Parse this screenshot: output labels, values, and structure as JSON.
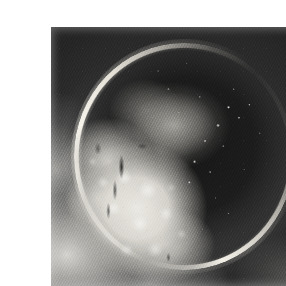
{
  "page": {
    "kind": "medical-photograph",
    "width": 286,
    "height": 286,
    "background_color": "#ffffff",
    "caption": ""
  },
  "photo": {
    "modality": "otoscopic / endoscopic still photograph",
    "color_mode": "grayscale",
    "alt": "Grayscale otoscopic photograph showing a dark circular canal lumen bounded by a bright crescent speculum reflection, containing a large whitish nodular cauliflower-like keratinous mass in the lower-left and mid-gray mucosal soft tissue with scattered specular highlights in the upper-right.",
    "frame": {
      "left": 11,
      "top": 11,
      "width": 261,
      "height": 259
    },
    "colors": {
      "paper": "#ffffff",
      "surrounding_tissue": "#4a4a4a",
      "canal_dark": "#161616",
      "rim_highlight": "#fffdf5",
      "nodular_mass": "#efede6",
      "mucosal_mass": "#b0aea8",
      "peripheral_light_tissue": "#e0ded9"
    },
    "regions": [
      {
        "name": "speculum-rim-arc",
        "description": "Bright crescent highlight forming a near-complete circle",
        "tone": "highlight"
      },
      {
        "name": "canal-lumen",
        "description": "Dark interior of the ear canal / lumen, upper-right dominant",
        "tone": "dark"
      },
      {
        "name": "nodular-keratin-mass",
        "description": "Large white lobulated cauliflower-like mass, lower-left quadrant",
        "tone": "bright"
      },
      {
        "name": "mucosal-soft-tissue",
        "description": "Mid-gray soft tissue band across the center",
        "tone": "mid"
      },
      {
        "name": "peripheral-tissue",
        "description": "Lighter skin/tissue outside the circular rim, strongest at lower-left",
        "tone": "light-mid"
      },
      {
        "name": "specular-highlights",
        "description": "Scattered small bright specks from flash on moist mucosa",
        "tone": "highlight"
      }
    ],
    "texture": {
      "halftone": "diagonal printed halftone screen",
      "grain": "film grain"
    }
  }
}
